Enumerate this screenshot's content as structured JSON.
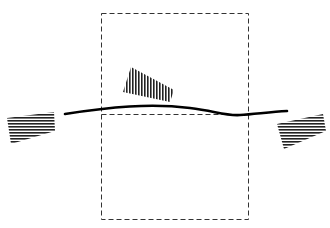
{
  "diagram": {
    "colors": {
      "background": "#ffffff",
      "line": "#000000",
      "dash": "#333333",
      "hatch": "#222222"
    },
    "elements": [
      {
        "id": "dashed-region",
        "type": "dashed-rectangle",
        "divided": true,
        "division": "horizontal-midline"
      },
      {
        "id": "main-curve",
        "type": "thick-wavy-line"
      },
      {
        "id": "top-block",
        "type": "hatched-quadrilateral",
        "hatch": "vertical"
      },
      {
        "id": "left-block",
        "type": "hatched-quadrilateral",
        "hatch": "horizontal"
      },
      {
        "id": "right-block",
        "type": "hatched-quadrilateral",
        "hatch": "horizontal"
      }
    ]
  }
}
